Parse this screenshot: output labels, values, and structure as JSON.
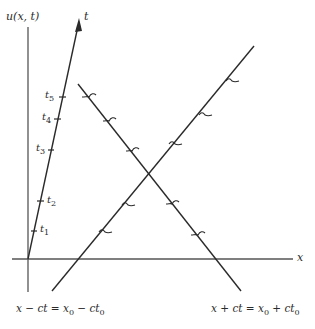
{
  "diagram": {
    "colors": {
      "line": "#2a2a2a",
      "axis": "#555555",
      "background": "#ffffff"
    },
    "axes": {
      "vertical_label": "u(x, t)",
      "horizontal_label": "x",
      "time_axis_label": "t"
    },
    "time_ticks": [
      {
        "base": "t",
        "sub": "1"
      },
      {
        "base": "t",
        "sub": "2"
      },
      {
        "base": "t",
        "sub": "3"
      },
      {
        "base": "t",
        "sub": "4"
      },
      {
        "base": "t",
        "sub": "5"
      }
    ],
    "characteristics": [
      {
        "name": "left-characteristic",
        "lhs": "x − ct = x",
        "sub1": "0",
        "mid": " − ct",
        "sub2": "0"
      },
      {
        "name": "right-characteristic",
        "lhs": "x + ct = x",
        "sub1": "0",
        "mid": " + ct",
        "sub2": "0"
      }
    ]
  }
}
